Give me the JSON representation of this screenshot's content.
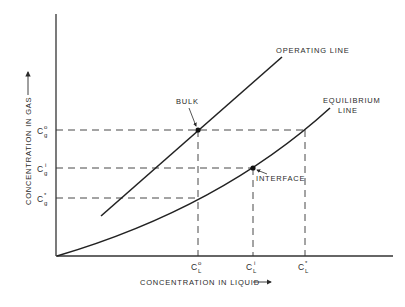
{
  "diagram": {
    "type": "two-film theory concentration diagram",
    "x_axis_label": "CONCENTRATION IN LIQUID",
    "y_axis_label": "CONCENTRATION IN GAS",
    "curves": {
      "operating_line": "OPERATING LINE",
      "equilibrium_line_1": "EQUILIBRIUM",
      "equilibrium_line_2": "LINE"
    },
    "points": {
      "bulk": "BULK",
      "interface": "INTERFACE"
    },
    "y_ticks": [
      {
        "base": "C",
        "sub": "g",
        "sup": "o"
      },
      {
        "base": "C",
        "sub": "g",
        "sup": "i"
      },
      {
        "base": "C",
        "sub": "g",
        "sup": "*"
      }
    ],
    "x_ticks": [
      {
        "base": "C",
        "sub": "L",
        "sup": "o"
      },
      {
        "base": "C",
        "sub": "L",
        "sup": "i"
      },
      {
        "base": "C",
        "sub": "L",
        "sup": "*"
      }
    ]
  }
}
